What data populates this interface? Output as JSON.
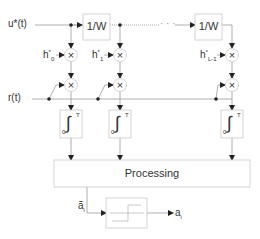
{
  "diagram": {
    "title": "",
    "input_labels": {
      "u": "u*(t)",
      "r": "r(t)"
    },
    "delay_blocks": [
      {
        "label": "1/W"
      },
      {
        "label": "1/W"
      }
    ],
    "ellipsis": "· · ·",
    "taps": [
      {
        "h": "h",
        "sup": "*",
        "sub": "0"
      },
      {
        "h": "h",
        "sup": "*",
        "sub": "1"
      },
      {
        "h": "h",
        "sup": "*",
        "sub": "L-1"
      }
    ],
    "multiplier_symbol": "×",
    "integrator": {
      "symbol": "∫",
      "lower": "0",
      "upper": "T"
    },
    "processing_label": "Processing",
    "decision": {
      "input_label": "ã",
      "input_sub": "i",
      "output_label": "a",
      "output_sub": "i"
    }
  },
  "colors": {
    "line": "#8a8a8a",
    "box": "#c8c8c8",
    "text": "#333333"
  }
}
